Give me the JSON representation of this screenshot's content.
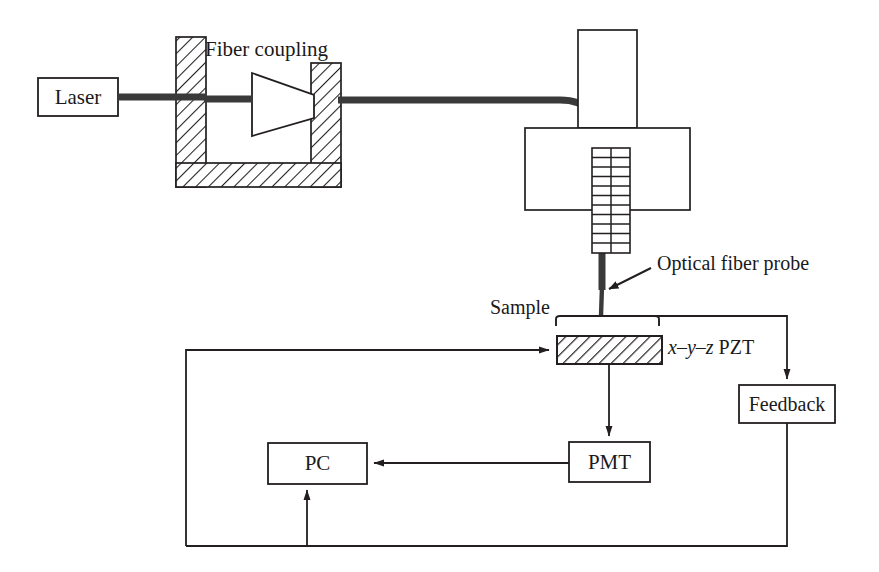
{
  "diagram": {
    "stroke_color": "#231f20",
    "fiber_color": "#3a3a3a",
    "background": "#ffffff"
  },
  "components": {
    "laser": {
      "label": "Laser",
      "x": 38,
      "y": 78,
      "w": 80,
      "h": 38
    },
    "fiber_coupling": {
      "label": "Fiber coupling",
      "label_x": 205,
      "label_y": 38
    },
    "lens": {
      "name": "coupling-lens"
    },
    "probe_holder_vertical": {
      "name": "probe-holder-upper"
    },
    "probe_holder_horizontal": {
      "name": "probe-holder-lower"
    },
    "piezo_grid": {
      "name": "dither-piezo-grid",
      "columns": 2,
      "rows": 11
    },
    "optical_fiber_probe": {
      "label": "Optical fiber probe",
      "label_x": 657,
      "label_y": 253
    },
    "sample": {
      "label": "Sample",
      "label_x": 492,
      "label_y": 297
    },
    "pzt": {
      "label_italic_x": "x",
      "label_dash1": "–",
      "label_italic_y": "y",
      "label_dash2": "–",
      "label_italic_z": "z",
      "label_rest": "PZT",
      "label_x": 668,
      "label_y": 338
    },
    "feedback": {
      "label": "Feedback",
      "x": 739,
      "y": 385,
      "w": 96,
      "h": 38
    },
    "pmt": {
      "label": "PMT",
      "x": 569,
      "y": 442,
      "w": 81,
      "h": 40
    },
    "pc": {
      "label": "PC",
      "x": 268,
      "y": 443,
      "w": 99,
      "h": 41
    }
  },
  "signal_paths": [
    {
      "name": "laser-to-coupling",
      "type": "fiber"
    },
    {
      "name": "coupling-to-probe",
      "type": "fiber"
    },
    {
      "name": "probe-tip-to-feedback",
      "type": "wire-arrow"
    },
    {
      "name": "feedback-to-bottom-rail",
      "type": "wire"
    },
    {
      "name": "bottom-rail-to-pc",
      "type": "wire-arrow"
    },
    {
      "name": "pmt-to-pc",
      "type": "wire-arrow"
    },
    {
      "name": "sample-to-pmt",
      "type": "wire-arrow"
    },
    {
      "name": "pc-loop-to-pzt",
      "type": "wire-arrow"
    }
  ]
}
